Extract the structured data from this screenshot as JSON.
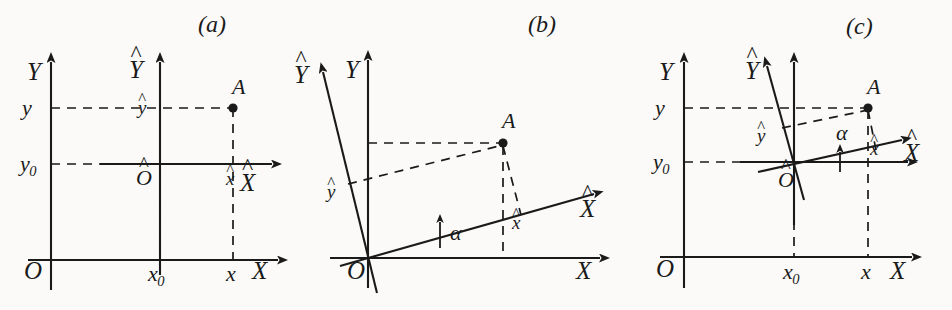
{
  "figure": {
    "background_color": "#fbfaf8",
    "ink_color": "#1a1a1a",
    "width": 952,
    "height": 310
  },
  "panels": [
    {
      "id": "a",
      "tag": "(a)",
      "transform_type": "translation",
      "labels": {
        "axis_Y": "Y",
        "axis_X": "X",
        "axis_Y_hat": "Y",
        "axis_X_hat": "X",
        "origin_O": "O",
        "origin_O_hat": "O",
        "point_A": "A",
        "tick_y": "y",
        "tick_y0": "y",
        "tick_y0_sub": "0",
        "tick_x0": "x",
        "tick_x0_sub": "0",
        "tick_x": "x",
        "coord_x_hat": "x",
        "coord_y_hat": "y"
      }
    },
    {
      "id": "b",
      "tag": "(b)",
      "transform_type": "rotation",
      "labels": {
        "axis_Y": "Y",
        "axis_X": "X",
        "axis_Y_hat": "Y",
        "axis_X_hat": "X",
        "origin_O": "O",
        "point_A": "A",
        "angle_alpha": "α",
        "coord_x_hat": "x",
        "coord_y_hat": "y"
      }
    },
    {
      "id": "c",
      "tag": "(c)",
      "transform_type": "translation-and-rotation",
      "labels": {
        "axis_Y": "Y",
        "axis_X": "X",
        "axis_Y_hat": "Y",
        "axis_X_hat": "X",
        "origin_O": "O",
        "origin_O_hat": "O",
        "point_A": "A",
        "angle_alpha": "α",
        "tick_y": "y",
        "tick_y0": "y",
        "tick_y0_sub": "0",
        "tick_x0": "x",
        "tick_x0_sub": "0",
        "tick_x": "x",
        "coord_x_hat": "x",
        "coord_y_hat": "y"
      }
    }
  ]
}
